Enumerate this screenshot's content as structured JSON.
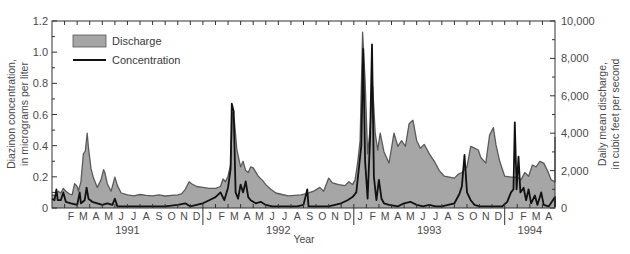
{
  "chart_data": {
    "type": "line",
    "title": "",
    "xlabel": "Year",
    "ylabel_left": "Diazinon concentration, in micrograms per liter",
    "ylabel_left_lines": [
      "Diazinon concentration,",
      "in micrograms per liter"
    ],
    "ylabel_right": "Daily mean discharge, in cubic feet per second",
    "ylabel_right_lines": [
      "Daily mean discharge,",
      "in cubic feet per second"
    ],
    "ylim_left": [
      0,
      1.2
    ],
    "yticks_left": [
      "0",
      "0.2",
      "0.4",
      "0.6",
      "0.8",
      "1.0",
      "1.2"
    ],
    "ylim_right": [
      0,
      10000
    ],
    "yticks_right": [
      "0",
      "2,000",
      "4,000",
      "6,000",
      "8,000",
      "10,000"
    ],
    "x_range_months": [
      0,
      40
    ],
    "x_start": "January 1991",
    "x_end": "April 1994",
    "month_labels": [
      {
        "m": 1,
        "label": "F"
      },
      {
        "m": 2,
        "label": "M"
      },
      {
        "m": 3,
        "label": "A"
      },
      {
        "m": 4,
        "label": "M"
      },
      {
        "m": 5,
        "label": "J"
      },
      {
        "m": 6,
        "label": "J"
      },
      {
        "m": 7,
        "label": "A"
      },
      {
        "m": 8,
        "label": "S"
      },
      {
        "m": 9,
        "label": "O"
      },
      {
        "m": 10,
        "label": "N"
      },
      {
        "m": 11,
        "label": "D"
      },
      {
        "m": 12,
        "label": "J"
      },
      {
        "m": 13,
        "label": "F"
      },
      {
        "m": 14,
        "label": "M"
      },
      {
        "m": 15,
        "label": "A"
      },
      {
        "m": 16,
        "label": "M"
      },
      {
        "m": 17,
        "label": "J"
      },
      {
        "m": 18,
        "label": "J"
      },
      {
        "m": 19,
        "label": "A"
      },
      {
        "m": 20,
        "label": "S"
      },
      {
        "m": 21,
        "label": "O"
      },
      {
        "m": 22,
        "label": "N"
      },
      {
        "m": 23,
        "label": "D"
      },
      {
        "m": 24,
        "label": "J"
      },
      {
        "m": 25,
        "label": "F"
      },
      {
        "m": 26,
        "label": "M"
      },
      {
        "m": 27,
        "label": "A"
      },
      {
        "m": 28,
        "label": "M"
      },
      {
        "m": 29,
        "label": "J"
      },
      {
        "m": 30,
        "label": "J"
      },
      {
        "m": 31,
        "label": "A"
      },
      {
        "m": 32,
        "label": "S"
      },
      {
        "m": 33,
        "label": "O"
      },
      {
        "m": 34,
        "label": "N"
      },
      {
        "m": 35,
        "label": "D"
      },
      {
        "m": 36,
        "label": "J"
      },
      {
        "m": 37,
        "label": "F"
      },
      {
        "m": 38,
        "label": "M"
      },
      {
        "m": 39,
        "label": "A"
      }
    ],
    "year_labels": [
      {
        "label": "1991",
        "center_month": 6
      },
      {
        "label": "1992",
        "center_month": 18
      },
      {
        "label": "1993",
        "center_month": 30
      },
      {
        "label": "1994",
        "center_month": 38
      }
    ],
    "year_dividers": [
      12,
      24,
      36
    ],
    "legend": {
      "position": "upper-left",
      "entries": [
        {
          "name": "Discharge",
          "style": "filled-area",
          "color": "#a6a6a6",
          "edge": "#555555"
        },
        {
          "name": "Concentration",
          "style": "line",
          "color": "#111111"
        }
      ]
    },
    "series": [
      {
        "name": "Discharge",
        "axis": "right",
        "units": "cubic feet per second",
        "color": "#a6a6a6",
        "edge_color": "#5a5a5a",
        "points_month_value": [
          [
            0.0,
            700
          ],
          [
            0.3,
            650
          ],
          [
            0.5,
            900
          ],
          [
            0.7,
            800
          ],
          [
            0.9,
            1050
          ],
          [
            1.1,
            900
          ],
          [
            1.4,
            750
          ],
          [
            1.6,
            700
          ],
          [
            1.8,
            1300
          ],
          [
            2.0,
            1150
          ],
          [
            2.1,
            900
          ],
          [
            2.3,
            1400
          ],
          [
            2.5,
            2900
          ],
          [
            2.65,
            3050
          ],
          [
            2.8,
            4000
          ],
          [
            2.9,
            3200
          ],
          [
            3.1,
            2100
          ],
          [
            3.3,
            1600
          ],
          [
            3.6,
            1100
          ],
          [
            3.9,
            1500
          ],
          [
            4.1,
            2050
          ],
          [
            4.2,
            1900
          ],
          [
            4.4,
            1300
          ],
          [
            4.7,
            900
          ],
          [
            4.9,
            1400
          ],
          [
            5.0,
            1650
          ],
          [
            5.2,
            1200
          ],
          [
            5.5,
            800
          ],
          [
            6.0,
            700
          ],
          [
            6.5,
            650
          ],
          [
            7.0,
            720
          ],
          [
            7.5,
            680
          ],
          [
            8.0,
            650
          ],
          [
            8.5,
            700
          ],
          [
            9.0,
            640
          ],
          [
            9.5,
            680
          ],
          [
            10.0,
            700
          ],
          [
            10.3,
            760
          ],
          [
            10.6,
            1000
          ],
          [
            10.9,
            1400
          ],
          [
            11.1,
            1300
          ],
          [
            11.5,
            1150
          ],
          [
            12.0,
            1100
          ],
          [
            12.5,
            1050
          ],
          [
            13.0,
            1050
          ],
          [
            13.4,
            1150
          ],
          [
            13.6,
            1550
          ],
          [
            13.8,
            1400
          ],
          [
            14.0,
            1700
          ],
          [
            14.2,
            2300
          ],
          [
            14.35,
            5100
          ],
          [
            14.5,
            4700
          ],
          [
            14.7,
            3100
          ],
          [
            15.0,
            2200
          ],
          [
            15.2,
            2500
          ],
          [
            15.4,
            2000
          ],
          [
            15.6,
            1900
          ],
          [
            15.8,
            2200
          ],
          [
            16.0,
            2150
          ],
          [
            16.4,
            1700
          ],
          [
            16.7,
            1500
          ],
          [
            17.0,
            1250
          ],
          [
            17.4,
            1000
          ],
          [
            17.8,
            800
          ],
          [
            18.3,
            720
          ],
          [
            18.8,
            650
          ],
          [
            19.3,
            680
          ],
          [
            19.8,
            700
          ],
          [
            20.3,
            780
          ],
          [
            20.8,
            900
          ],
          [
            21.3,
            1100
          ],
          [
            21.6,
            900
          ],
          [
            22.0,
            1600
          ],
          [
            22.3,
            1350
          ],
          [
            22.8,
            1250
          ],
          [
            23.3,
            1200
          ],
          [
            23.6,
            1400
          ],
          [
            23.9,
            1250
          ],
          [
            24.1,
            1500
          ],
          [
            24.3,
            2400
          ],
          [
            24.5,
            3600
          ],
          [
            24.7,
            9400
          ],
          [
            24.9,
            6800
          ],
          [
            25.1,
            2900
          ],
          [
            25.3,
            4200
          ],
          [
            25.5,
            6500
          ],
          [
            25.7,
            4000
          ],
          [
            25.9,
            3100
          ],
          [
            26.1,
            4000
          ],
          [
            26.4,
            3000
          ],
          [
            26.8,
            2400
          ],
          [
            27.2,
            4000
          ],
          [
            27.5,
            3300
          ],
          [
            27.8,
            3600
          ],
          [
            28.1,
            3300
          ],
          [
            28.4,
            4500
          ],
          [
            28.7,
            4700
          ],
          [
            29.0,
            3600
          ],
          [
            29.3,
            3200
          ],
          [
            29.6,
            3400
          ],
          [
            30.0,
            2900
          ],
          [
            30.4,
            2500
          ],
          [
            30.8,
            2000
          ],
          [
            31.2,
            1700
          ],
          [
            31.6,
            1650
          ],
          [
            32.0,
            1600
          ],
          [
            32.3,
            1800
          ],
          [
            32.6,
            1900
          ],
          [
            33.0,
            2200
          ],
          [
            33.3,
            3300
          ],
          [
            33.6,
            3200
          ],
          [
            33.9,
            3100
          ],
          [
            34.1,
            2700
          ],
          [
            34.5,
            2400
          ],
          [
            34.8,
            3900
          ],
          [
            35.1,
            4300
          ],
          [
            35.3,
            3400
          ],
          [
            35.6,
            2500
          ],
          [
            36.0,
            1700
          ],
          [
            36.5,
            1650
          ],
          [
            37.0,
            1650
          ],
          [
            37.3,
            1500
          ],
          [
            37.6,
            1900
          ],
          [
            37.9,
            1700
          ],
          [
            38.2,
            2300
          ],
          [
            38.5,
            2200
          ],
          [
            38.8,
            2500
          ],
          [
            39.1,
            2400
          ],
          [
            39.4,
            2000
          ],
          [
            39.7,
            1500
          ],
          [
            40.0,
            1400
          ],
          [
            40.3,
            1400
          ],
          [
            40.6,
            3800
          ]
        ]
      },
      {
        "name": "Concentration",
        "axis": "left",
        "units": "micrograms per liter",
        "color": "#111111",
        "points_month_value": [
          [
            0.0,
            0.06
          ],
          [
            0.2,
            0.05
          ],
          [
            0.35,
            0.12
          ],
          [
            0.45,
            0.05
          ],
          [
            0.7,
            0.05
          ],
          [
            0.9,
            0.1
          ],
          [
            1.1,
            0.04
          ],
          [
            1.5,
            0.03
          ],
          [
            2.0,
            0.02
          ],
          [
            2.2,
            0.1
          ],
          [
            2.3,
            0.03
          ],
          [
            2.6,
            0.05
          ],
          [
            2.75,
            0.13
          ],
          [
            2.9,
            0.06
          ],
          [
            3.2,
            0.04
          ],
          [
            3.6,
            0.03
          ],
          [
            4.0,
            0.02
          ],
          [
            4.4,
            0.03
          ],
          [
            4.8,
            0.02
          ],
          [
            5.0,
            0.06
          ],
          [
            5.2,
            0.01
          ],
          [
            6.0,
            0.01
          ],
          [
            7.0,
            0.01
          ],
          [
            8.0,
            0.01
          ],
          [
            9.0,
            0.01
          ],
          [
            10.0,
            0.02
          ],
          [
            10.6,
            0.03
          ],
          [
            11.0,
            0.01
          ],
          [
            11.5,
            0.02
          ],
          [
            12.0,
            0.03
          ],
          [
            12.5,
            0.05
          ],
          [
            13.0,
            0.07
          ],
          [
            13.4,
            0.1
          ],
          [
            13.7,
            0.05
          ],
          [
            14.0,
            0.13
          ],
          [
            14.2,
            0.25
          ],
          [
            14.3,
            0.67
          ],
          [
            14.45,
            0.62
          ],
          [
            14.6,
            0.1
          ],
          [
            14.8,
            0.06
          ],
          [
            15.0,
            0.15
          ],
          [
            15.2,
            0.1
          ],
          [
            15.4,
            0.17
          ],
          [
            15.6,
            0.07
          ],
          [
            15.8,
            0.05
          ],
          [
            16.2,
            0.03
          ],
          [
            16.6,
            0.04
          ],
          [
            17.0,
            0.02
          ],
          [
            17.5,
            0.01
          ],
          [
            18.0,
            0.01
          ],
          [
            18.5,
            0.01
          ],
          [
            19.0,
            0.01
          ],
          [
            19.5,
            0.01
          ],
          [
            20.0,
            0.02
          ],
          [
            20.3,
            0.12
          ],
          [
            20.4,
            0.01
          ],
          [
            21.0,
            0.01
          ],
          [
            22.0,
            0.01
          ],
          [
            22.5,
            0.02
          ],
          [
            23.0,
            0.03
          ],
          [
            23.5,
            0.05
          ],
          [
            23.9,
            0.07
          ],
          [
            24.2,
            0.1
          ],
          [
            24.4,
            0.25
          ],
          [
            24.6,
            0.4
          ],
          [
            24.75,
            1.02
          ],
          [
            24.9,
            0.3
          ],
          [
            25.1,
            0.06
          ],
          [
            25.3,
            0.45
          ],
          [
            25.45,
            1.05
          ],
          [
            25.6,
            0.2
          ],
          [
            25.8,
            0.05
          ],
          [
            26.0,
            0.18
          ],
          [
            26.2,
            0.06
          ],
          [
            26.4,
            0.03
          ],
          [
            26.8,
            0.02
          ],
          [
            27.5,
            0.01
          ],
          [
            28.0,
            0.03
          ],
          [
            28.5,
            0.04
          ],
          [
            29.0,
            0.02
          ],
          [
            29.5,
            0.01
          ],
          [
            30.0,
            0.02
          ],
          [
            30.5,
            0.01
          ],
          [
            31.0,
            0.01
          ],
          [
            31.5,
            0.02
          ],
          [
            32.0,
            0.03
          ],
          [
            32.4,
            0.09
          ],
          [
            32.6,
            0.14
          ],
          [
            32.8,
            0.34
          ],
          [
            33.0,
            0.1
          ],
          [
            33.3,
            0.05
          ],
          [
            33.6,
            0.02
          ],
          [
            34.0,
            0.01
          ],
          [
            35.0,
            0.01
          ],
          [
            35.8,
            0.01
          ],
          [
            36.2,
            0.04
          ],
          [
            36.5,
            0.1
          ],
          [
            36.7,
            0.12
          ],
          [
            36.8,
            0.55
          ],
          [
            36.95,
            0.12
          ],
          [
            37.1,
            0.33
          ],
          [
            37.25,
            0.1
          ],
          [
            37.5,
            0.13
          ],
          [
            37.7,
            0.05
          ],
          [
            37.9,
            0.12
          ],
          [
            38.1,
            0.03
          ],
          [
            38.4,
            0.08
          ],
          [
            38.6,
            0.02
          ],
          [
            38.9,
            0.1
          ],
          [
            39.1,
            0.02
          ],
          [
            39.5,
            0.01
          ],
          [
            40.0,
            0.07
          ],
          [
            40.1,
            0.01
          ],
          [
            40.6,
            0.02
          ]
        ]
      }
    ]
  }
}
